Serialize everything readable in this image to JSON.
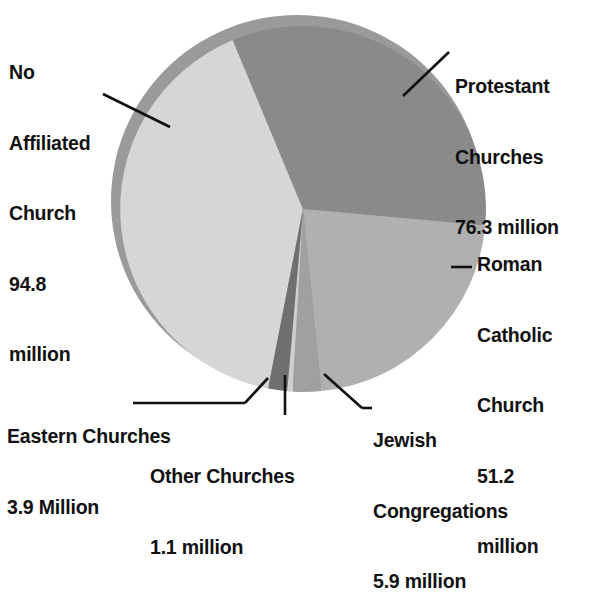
{
  "chart_data": {
    "type": "pie",
    "title": "",
    "unit": "million",
    "total": 233.2,
    "categories": [
      "No Affiliated Church",
      "Protestant Churches",
      "Roman Catholic Church",
      "Jewish Congregations",
      "Other Churches",
      "Eastern Churches"
    ],
    "values": [
      94.8,
      76.3,
      51.2,
      5.9,
      1.1,
      3.9
    ],
    "colors": [
      "#d6d6d6",
      "#8a8a8a",
      "#b0b0b0",
      "#a0a0a0",
      "#cfcfcf",
      "#6f6f6f"
    ],
    "slices": [
      {
        "name": "No Affiliated Church",
        "value": 94.8,
        "unit": "million",
        "color": "#d6d6d6",
        "start_deg": 191.0,
        "end_deg": 337.4
      },
      {
        "name": "Protestant Churches",
        "value": 76.3,
        "unit": "million",
        "color": "#8a8a8a",
        "start_deg": 337.4,
        "end_deg": 455.2
      },
      {
        "name": "Roman Catholic Church",
        "value": 51.2,
        "unit": "million",
        "color": "#b0b0b0",
        "start_deg": 455.2,
        "end_deg": 534.2
      },
      {
        "name": "Jewish Congregations",
        "value": 5.9,
        "unit": "million",
        "color": "#a0a0a0",
        "start_deg": 534.2,
        "end_deg": 543.3
      },
      {
        "name": "Other Churches",
        "value": 1.1,
        "unit": "million",
        "color": "#cfcfcf",
        "start_deg": 543.3,
        "end_deg": 545.0
      },
      {
        "name": "Eastern Churches",
        "value": 3.9,
        "unit": "million",
        "color": "#6f6f6f",
        "start_deg": 545.0,
        "end_deg": 551.0
      }
    ],
    "legend": "none",
    "grid": false
  },
  "labels": {
    "no_affiliated": {
      "line1": "No",
      "line2": "Affiliated",
      "line3": "Church",
      "line4": "94.8",
      "line5": "million"
    },
    "protestant": {
      "line1": "Protestant",
      "line2": "Churches",
      "line3": "76.3 million"
    },
    "roman_catholic": {
      "line1": "Roman",
      "line2": "Catholic",
      "line3": "Church",
      "line4": "51.2",
      "line5": "million"
    },
    "eastern": {
      "line1": "Eastern Churches",
      "line2": "3.9 Million"
    },
    "other": {
      "line1": "Other Churches",
      "line2": "1.1 million"
    },
    "jewish": {
      "line1": "Jewish",
      "line2": "Congregations",
      "line3": "5.9 million"
    }
  },
  "style": {
    "background": "#ffffff",
    "text_color": "#111111",
    "leader_color": "#111111",
    "shadow_ring": "#9a9a9a"
  }
}
